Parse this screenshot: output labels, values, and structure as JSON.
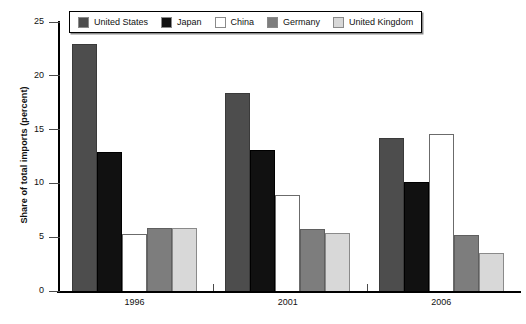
{
  "chart_data": {
    "type": "bar",
    "title": "",
    "xlabel": "",
    "ylabel": "Share of total imports (percent)",
    "categories": [
      "1996",
      "2001",
      "2006"
    ],
    "ylim": [
      0,
      25
    ],
    "yticks": [
      0,
      5,
      10,
      15,
      20,
      25
    ],
    "ytick_labels": [
      "0",
      "5",
      "10",
      "15",
      "20",
      "25"
    ],
    "grid": false,
    "legend_position": "top-inside",
    "series": [
      {
        "name": "United States",
        "color": "#4d4d4d",
        "border": "#3a3a3a",
        "values": [
          23.0,
          18.4,
          14.2
        ]
      },
      {
        "name": "Japan",
        "color": "#111111",
        "border": "#000000",
        "values": [
          12.9,
          13.1,
          10.1
        ]
      },
      {
        "name": "China",
        "color": "#ffffff",
        "border": "#6b6b6b",
        "values": [
          5.3,
          8.9,
          14.6
        ]
      },
      {
        "name": "Germany",
        "color": "#7d7d7d",
        "border": "#5f5f5f",
        "values": [
          5.9,
          5.8,
          5.2
        ]
      },
      {
        "name": "United Kingdom",
        "color": "#d8d8d8",
        "border": "#8a8a8a",
        "values": [
          5.9,
          5.4,
          3.5
        ]
      }
    ]
  },
  "axis": {
    "y_title": "Share of total imports (percent)"
  },
  "legend": {
    "items": [
      {
        "label": "United States",
        "swatch": "#4d4d4d"
      },
      {
        "label": "Japan",
        "swatch": "#111111"
      },
      {
        "label": "China",
        "swatch": "#ffffff"
      },
      {
        "label": "Germany",
        "swatch": "#7d7d7d"
      },
      {
        "label": "United Kingdom",
        "swatch": "#d8d8d8"
      }
    ]
  }
}
